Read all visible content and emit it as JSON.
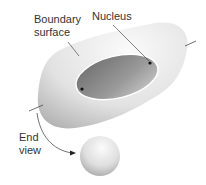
{
  "labels": {
    "boundary_line1": "Boundary",
    "boundary_line2": "surface",
    "nucleus": "Nucleus",
    "end_line1": "End",
    "end_line2": "view"
  },
  "colors": {
    "surface_light": "#f4f4f4",
    "surface_dark": "#b8b8b8",
    "inner_dark": "#7a7a7a",
    "inner_light": "#d8d8d8",
    "line": "#333333"
  }
}
